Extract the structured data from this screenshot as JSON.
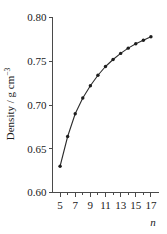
{
  "chart_data": {
    "type": "line",
    "title": "",
    "subtitle": "",
    "xlabel": "n",
    "ylabel": "Density / g cm",
    "ylabel_exponent": "−3",
    "ylabel_full": "Density / g cm−3",
    "x": [
      5,
      6,
      7,
      8,
      9,
      10,
      11,
      12,
      13,
      14,
      15,
      16,
      17
    ],
    "values": [
      0.63,
      0.664,
      0.69,
      0.708,
      0.722,
      0.734,
      0.744,
      0.752,
      0.759,
      0.765,
      0.77,
      0.774,
      0.778
    ],
    "series": [
      {
        "name": "density",
        "values": [
          0.63,
          0.664,
          0.69,
          0.708,
          0.722,
          0.734,
          0.744,
          0.752,
          0.759,
          0.765,
          0.77,
          0.774,
          0.778
        ]
      }
    ],
    "xlim": [
      4,
      18
    ],
    "ylim": [
      0.6,
      0.8
    ],
    "xticks": [
      5,
      7,
      9,
      11,
      13,
      15,
      17
    ],
    "xtick_labels": [
      "5",
      "7",
      "9",
      "11",
      "13",
      "15",
      "17"
    ],
    "x_minor_ticks": [
      6,
      8,
      10,
      12,
      14,
      16
    ],
    "yticks": [
      0.6,
      0.65,
      0.7,
      0.75,
      0.8
    ],
    "ytick_labels": [
      "0.60",
      "0.65",
      "0.70",
      "0.75",
      "0.80"
    ],
    "grid": false,
    "legend": false,
    "legend_position": "none",
    "marker": "circle",
    "line_color": "#2b2b2b",
    "marker_color": "#1d1d1d",
    "axis_color": "#4a4a4a",
    "background_color": "#ffffff"
  }
}
